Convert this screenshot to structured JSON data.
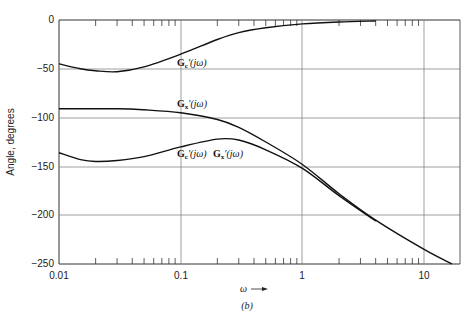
{
  "chart_data": {
    "type": "line",
    "title": "",
    "xlabel": "ω →",
    "ylabel": "Angle, degrees",
    "caption": "(b)",
    "xscale": "log",
    "xlim": [
      0.01,
      20
    ],
    "ylim": [
      -250,
      0
    ],
    "grid": true,
    "x_ticks": [
      "0.01",
      "0.1",
      "1",
      "10"
    ],
    "y_ticks": [
      "0",
      "−50",
      "−100",
      "−150",
      "−200",
      "−250"
    ],
    "series": [
      {
        "name": "Gc'(jω)",
        "x": [
          0.01,
          0.015,
          0.02,
          0.03,
          0.05,
          0.1,
          0.2,
          0.3,
          0.5,
          1,
          2,
          4
        ],
        "values": [
          -45,
          -50,
          -52,
          -53,
          -48,
          -35,
          -20,
          -13,
          -8,
          -4,
          -2,
          -1
        ]
      },
      {
        "name": "Gx'(jω)",
        "x": [
          0.01,
          0.03,
          0.05,
          0.1,
          0.2,
          0.3,
          0.5,
          1,
          2,
          4,
          10,
          17
        ],
        "values": [
          -91,
          -91,
          -92,
          -95,
          -102,
          -110,
          -125,
          -148,
          -178,
          -205,
          -235,
          -250
        ]
      },
      {
        "name": "Gc'(jω) Gx'(jω)",
        "x": [
          0.01,
          0.015,
          0.02,
          0.03,
          0.05,
          0.1,
          0.2,
          0.3,
          0.5,
          1,
          2,
          4
        ],
        "values": [
          -136,
          -143,
          -145,
          -144,
          -140,
          -130,
          -122,
          -123,
          -133,
          -152,
          -180,
          -206
        ]
      }
    ],
    "annotations": [
      {
        "text": "Gc'(jω)",
        "at": [
          0.1,
          -55
        ]
      },
      {
        "text": "Gx'(jω)",
        "at": [
          0.1,
          -85
        ]
      },
      {
        "text": "Gc'(jω) Gx'(jω)",
        "at": [
          0.1,
          -137
        ]
      }
    ]
  },
  "labels": {
    "y_axis": "Angle, degrees",
    "x_axis": "ω",
    "caption": "(b)",
    "curve_gc": "G",
    "curve_gc_sub": "c",
    "curve_gx": "G",
    "curve_gx_sub": "x",
    "jw": "′(jω)",
    "x_ticks": [
      "0.01",
      "0.1",
      "1",
      "10"
    ],
    "y_ticks": [
      "0",
      "−50",
      "−100",
      "−150",
      "−200",
      "−250"
    ]
  }
}
